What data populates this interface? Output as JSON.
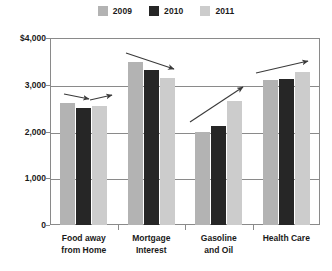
{
  "chart_data": {
    "type": "bar",
    "title": "",
    "subtitle": "",
    "xlabel": "",
    "ylabel": "",
    "ylim": [
      0,
      4000
    ],
    "y_ticks": [
      0,
      1000,
      2000,
      3000,
      4000
    ],
    "y_tick_labels": [
      "0",
      "1,000",
      "2,000",
      "3,000",
      "$4,000"
    ],
    "grid": true,
    "legend_position": "top-center",
    "categories": [
      "Food away from Home",
      "Mortgage Interest",
      "Gasoline and Oil",
      "Health Care"
    ],
    "category_lines": [
      [
        "Food away",
        "from Home"
      ],
      [
        "Mortgage",
        "Interest"
      ],
      [
        "Gasoline",
        "and Oil"
      ],
      [
        "Health Care"
      ]
    ],
    "series": [
      {
        "name": "2009",
        "color": "#b3b3b3",
        "values": [
          2600,
          3480,
          2000,
          3100
        ]
      },
      {
        "name": "2010",
        "color": "#262626",
        "values": [
          2510,
          3320,
          2120,
          3130
        ]
      },
      {
        "name": "2011",
        "color": "#cccccc",
        "values": [
          2540,
          3150,
          2650,
          3280
        ]
      }
    ],
    "annotations": [
      {
        "label": "trend-arrow-food-1",
        "group": "Food away from Home",
        "direction": "slightly-down",
        "x1": 64,
        "y1": 94,
        "x2": 89,
        "y2": 99
      },
      {
        "label": "trend-arrow-food-2",
        "group": "Food away from Home",
        "direction": "slightly-up",
        "x1": 90,
        "y1": 100,
        "x2": 112,
        "y2": 95
      },
      {
        "label": "trend-arrow-mortgage",
        "group": "Mortgage Interest",
        "direction": "down",
        "x1": 126,
        "y1": 53,
        "x2": 174,
        "y2": 69
      },
      {
        "label": "trend-arrow-gasoline",
        "group": "Gasoline and Oil",
        "direction": "up",
        "x1": 190,
        "y1": 122,
        "x2": 243,
        "y2": 87
      },
      {
        "label": "trend-arrow-healthcare",
        "group": "Health Care",
        "direction": "up",
        "x1": 256,
        "y1": 73,
        "x2": 308,
        "y2": 61
      }
    ]
  },
  "legend": {
    "entries": [
      {
        "label": "2009",
        "color": "#b3b3b3"
      },
      {
        "label": "2010",
        "color": "#262626"
      },
      {
        "label": "2011",
        "color": "#cccccc"
      }
    ]
  },
  "axis": {
    "y_labels": [
      {
        "text": "$4,000",
        "value": 4000
      },
      {
        "text": "3,000",
        "value": 3000
      },
      {
        "text": "2,000",
        "value": 2000
      },
      {
        "text": "1,000",
        "value": 1000
      },
      {
        "text": "0",
        "value": 0
      }
    ]
  },
  "colors": {
    "frame": "#8a8a8a",
    "grid": "#8a8a8a",
    "text": "#1a1a1a",
    "background": "#ffffff",
    "arrow": "#3a3a3a"
  }
}
